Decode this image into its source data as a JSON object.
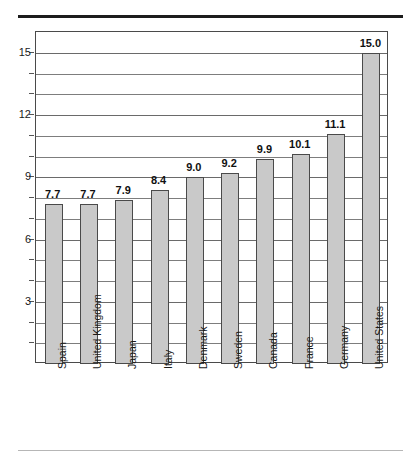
{
  "chart_data": {
    "type": "bar",
    "title": "",
    "subtitle": "",
    "xlabel": "",
    "ylabel": "",
    "orientation": "vertical",
    "grid": true,
    "legend": false,
    "ylim": [
      0,
      16
    ],
    "ymajor_ticks": [
      3,
      6,
      9,
      12,
      15
    ],
    "yminor_tick_step": 1,
    "ytick_labels": [
      "3",
      "6",
      "9",
      "12",
      "15"
    ],
    "categories": [
      "Spain",
      "United Kingdom",
      "Japan",
      "Italy",
      "Denmark",
      "Sweden",
      "Canada",
      "France",
      "Germany",
      "United States"
    ],
    "values": [
      7.7,
      7.7,
      7.9,
      8.4,
      9.0,
      9.2,
      9.9,
      10.1,
      11.1,
      15.0
    ],
    "value_labels": [
      "7.7",
      "7.7",
      "7.9",
      "8.4",
      "9.0",
      "9.2",
      "9.9",
      "10.1",
      "11.1",
      "15.0"
    ],
    "colors": {
      "bar_fill": "#c9c9c9",
      "bar_border": "#4a4a4a",
      "grid": "#7d7d7d",
      "frame": "#4a4a4a",
      "text": "#1a1a1a",
      "top_rule": "#1c1c1c",
      "bottom_rule": "#b6b6b6",
      "plot_background": "#ffffff"
    }
  }
}
